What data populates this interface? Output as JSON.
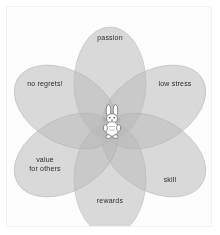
{
  "diagram": {
    "type": "venn-flower",
    "title": "",
    "petal_count": 6,
    "center_icon": "rabbit-icon",
    "colors": {
      "petal_fill": "#b9b9b9",
      "petal_stroke": "#aaaaaa",
      "background": "#fdfdfd",
      "frame_border": "#f1f1f1",
      "label_text": "#2b2b2b",
      "figure_fill": "#ffffff",
      "figure_stroke": "#777777"
    },
    "petals": [
      {
        "id": "passion",
        "label": "passion",
        "angle_deg": 90,
        "label_lines": [
          "passion"
        ]
      },
      {
        "id": "low-stress",
        "label": "low stress",
        "angle_deg": 30,
        "label_lines": [
          "low stress"
        ]
      },
      {
        "id": "skill",
        "label": "skill",
        "angle_deg": 330,
        "label_lines": [
          "skill"
        ]
      },
      {
        "id": "rewards",
        "label": "rewards",
        "angle_deg": 270,
        "label_lines": [
          "rewards"
        ]
      },
      {
        "id": "value-for-others",
        "label": "value for others",
        "angle_deg": 210,
        "label_lines": [
          "value",
          "for others"
        ]
      },
      {
        "id": "no-regrets",
        "label": "no regrets!",
        "angle_deg": 150,
        "label_lines": [
          "no regrets!"
        ]
      }
    ],
    "labels": {
      "passion": "passion",
      "low_stress": "low stress",
      "skill": "skill",
      "rewards": "rewards",
      "value_line1": "value",
      "value_line2": "for others",
      "no_regrets": "no regrets!"
    }
  }
}
